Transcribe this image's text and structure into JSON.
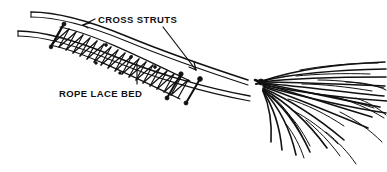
{
  "figure": {
    "background_color": "#ffffff",
    "ink_color": "#111111",
    "width": 387,
    "height": 172
  },
  "labels": {
    "cross_struts": "CROSS STRUTS",
    "rope_lace_bed": "ROPE LACE BED"
  },
  "callouts": [
    {
      "id": "cross-struts-left",
      "label": "CROSS STRUTS",
      "arrowhead": true,
      "points_to": "first cross strut at head of lace bed"
    },
    {
      "id": "cross-struts-right",
      "label": "CROSS STRUTS",
      "arrowhead": true,
      "points_to": "paired cross struts at foot of lace bed"
    },
    {
      "id": "rope-lace-bed",
      "label": "ROPE LACE BED",
      "arrowhead": false,
      "points_to": "laced rope webbing between the two poles"
    }
  ],
  "parts": [
    {
      "name": "drag-pole-upper",
      "description": "long upper pole, open cut tip at left"
    },
    {
      "name": "drag-pole-lower",
      "description": "long lower pole, open cut tip at left"
    },
    {
      "name": "rope-lace-bed",
      "description": "zigzag rope lacing spanning between the poles"
    },
    {
      "name": "cross-strut-head",
      "description": "cross strut lashed at the head of the bed"
    },
    {
      "name": "cross-strut-foot-1",
      "description": "first of paired cross struts at foot of bed"
    },
    {
      "name": "cross-strut-foot-2",
      "description": "second of paired cross struts at foot of bed"
    },
    {
      "name": "brush-bundle",
      "description": "fan of cut branches lashed to the pole ends"
    },
    {
      "name": "brush-lashing-knot",
      "description": "knot binding the brush bundle to the poles"
    }
  ],
  "lacing": {
    "rung_count": 22,
    "pattern": "diagonal zigzag"
  },
  "brush": {
    "branch_count": 26,
    "spread": "fan splayed up and down from lashing point"
  }
}
